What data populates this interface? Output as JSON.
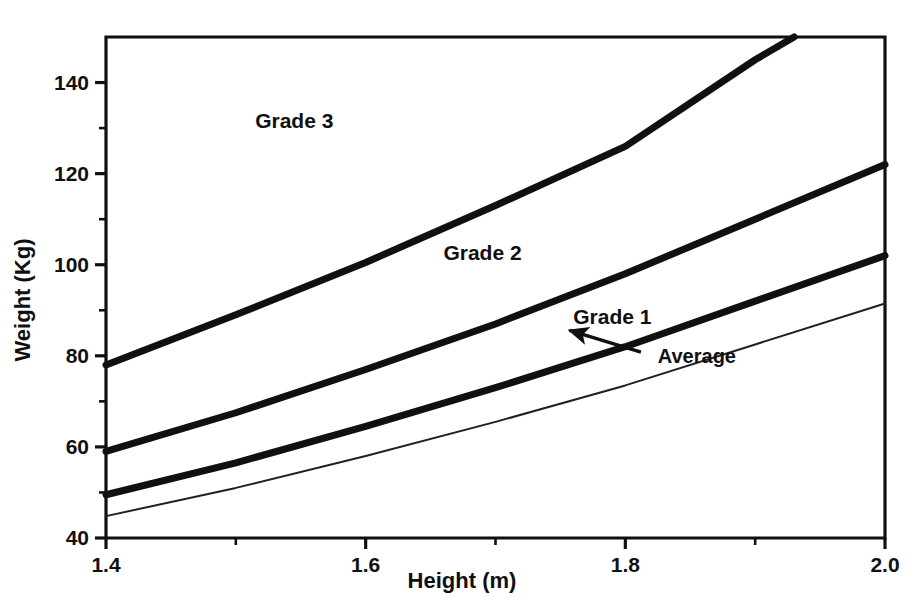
{
  "chart_data": {
    "type": "line",
    "title": "",
    "subtitle": "",
    "xlabel": "Height  (m)",
    "ylabel": "Weight (Kg)",
    "xlim": [
      1.4,
      2.0
    ],
    "ylim": [
      40,
      150
    ],
    "grid": false,
    "legend_position": "inline-annotations",
    "x_ticks_major": [
      "1.4",
      "1.6",
      "1.8",
      "2.0"
    ],
    "x_ticks_major_values": [
      1.4,
      1.6,
      1.8,
      2.0
    ],
    "x_ticks_minor_values": [
      1.5,
      1.7,
      1.9
    ],
    "y_ticks_major": [
      "40",
      "60",
      "80",
      "100",
      "120",
      "140"
    ],
    "y_ticks_major_values": [
      40,
      60,
      80,
      100,
      120,
      140
    ],
    "y_ticks_minor_values": [
      50,
      70,
      90,
      110,
      130
    ],
    "series": [
      {
        "name": "Grade 3 boundary",
        "style": "thick-solid",
        "color": "#101010",
        "x": [
          1.4,
          1.5,
          1.6,
          1.7,
          1.8,
          1.9,
          1.93
        ],
        "values": [
          78,
          89,
          100.5,
          113,
          126,
          145,
          150
        ]
      },
      {
        "name": "Grade 2 boundary",
        "style": "thick-solid",
        "color": "#101010",
        "x": [
          1.4,
          1.5,
          1.6,
          1.7,
          1.8,
          1.9,
          2.0
        ],
        "values": [
          59,
          67.5,
          77,
          87,
          98,
          110,
          122
        ]
      },
      {
        "name": "Grade 1 boundary",
        "style": "thick-solid",
        "color": "#101010",
        "x": [
          1.4,
          1.5,
          1.6,
          1.7,
          1.8,
          1.9,
          2.0
        ],
        "values": [
          49.5,
          56.5,
          64.5,
          73,
          82,
          92,
          102
        ]
      },
      {
        "name": "Average",
        "style": "thin-solid",
        "color": "#202020",
        "x": [
          1.4,
          1.5,
          1.6,
          1.7,
          1.8,
          1.9,
          2.0
        ],
        "values": [
          44.8,
          51,
          58,
          65.5,
          73.5,
          82.5,
          91.5
        ]
      }
    ],
    "region_labels": [
      {
        "text": "Grade  3",
        "x": 1.545,
        "y": 131.5
      },
      {
        "text": "Grade  2",
        "x": 1.69,
        "y": 102.5
      },
      {
        "text": "Grade  1",
        "x": 1.79,
        "y": 88.5
      }
    ],
    "annotations": [
      {
        "text": "Average",
        "label_x": 1.825,
        "label_y": 80.0,
        "arrow_tail_x": 1.812,
        "arrow_tail_y": 80.8,
        "arrow_tip_x": 1.757,
        "arrow_tip_y": 85.6
      }
    ]
  },
  "axes": {
    "x_title": "Height  (m)",
    "y_title": "Weight (Kg)"
  }
}
